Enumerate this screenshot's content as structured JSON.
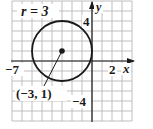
{
  "figure": {
    "radius_label": "r = 3",
    "center_label": "(−3, 1)",
    "x_axis_label": "x",
    "y_axis_label": "y",
    "tick_labels": {
      "x_min": "−7",
      "x_max": "2",
      "y_max": "4",
      "y_min": "−4"
    }
  },
  "geometry": {
    "grid_x_range": [
      -8,
      4
    ],
    "grid_y_range": [
      -6,
      6
    ],
    "circle": {
      "center": [
        -3,
        1
      ],
      "radius": 3
    }
  },
  "colors": {
    "grid": "#b8b8b8",
    "ink": "#1a1a1a",
    "background": "#ffffff"
  }
}
